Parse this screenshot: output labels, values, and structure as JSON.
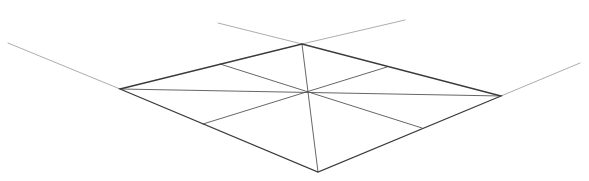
{
  "canvas": {
    "width": 589,
    "height": 181,
    "background": "#ffffff"
  },
  "colors": {
    "outline": "#3a3a3a",
    "inner": "#555555",
    "extension": "#8a8a8a"
  },
  "figure": {
    "vertices": {
      "left": [
        120,
        89
      ],
      "top": [
        302,
        44
      ],
      "right": [
        501,
        96
      ],
      "bottom": [
        318,
        172
      ],
      "center": [
        307,
        92
      ]
    },
    "midpoints": {
      "upper_left": [
        220,
        64
      ],
      "upper_right": [
        387,
        67
      ],
      "lower_left": [
        203,
        124
      ],
      "lower_right": [
        422,
        128
      ]
    },
    "extension_lines": [
      {
        "name": "left-extension",
        "from": [
          8,
          43
        ],
        "to": [
          120,
          89
        ]
      },
      {
        "name": "top-left-extension",
        "from": [
          218,
          23
        ],
        "to": [
          302,
          44
        ]
      },
      {
        "name": "top-right-extension",
        "from": [
          302,
          44
        ],
        "to": [
          405,
          20
        ]
      },
      {
        "name": "right-extension",
        "from": [
          501,
          96
        ],
        "to": [
          580,
          63
        ]
      }
    ]
  }
}
